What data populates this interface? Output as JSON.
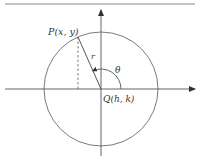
{
  "diagram": {
    "labels": {
      "point": "P(x, y)",
      "radius": "r",
      "angle": "θ",
      "center": "Q(h, k)"
    },
    "geometry": {
      "angle_theta_degrees": 114
    },
    "colors": {
      "stroke": "#6a6a6a",
      "axis": "#555555",
      "text": "#333333"
    }
  }
}
